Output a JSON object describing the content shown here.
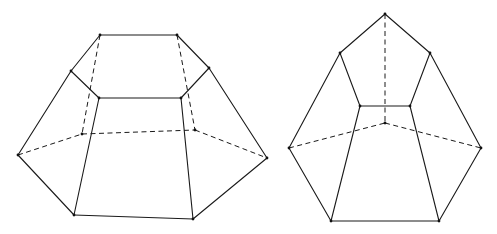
{
  "canvas": {
    "width": 497,
    "height": 234,
    "background": "#ffffff",
    "line_color": "#1a1a1a"
  },
  "figures": [
    {
      "name": "left-hexagonal-frustum",
      "vertices": {
        "t1": [
          100,
          35
        ],
        "t2": [
          177,
          35
        ],
        "tl": [
          71,
          71
        ],
        "tr": [
          209,
          68
        ],
        "fl": [
          99,
          98
        ],
        "fr": [
          181,
          98
        ],
        "bkL": [
          82,
          134
        ],
        "bkR": [
          195,
          130
        ],
        "L": [
          18,
          155
        ],
        "R": [
          267,
          158
        ],
        "bl": [
          74,
          215
        ],
        "br": [
          193,
          219
        ]
      },
      "solid_edges": [
        [
          "t1",
          "t2"
        ],
        [
          "t1",
          "tl"
        ],
        [
          "t2",
          "tr"
        ],
        [
          "tl",
          "fl"
        ],
        [
          "tr",
          "fr"
        ],
        [
          "fl",
          "fr"
        ],
        [
          "tl",
          "L"
        ],
        [
          "tr",
          "R"
        ],
        [
          "fl",
          "bl"
        ],
        [
          "fr",
          "br"
        ],
        [
          "L",
          "bl"
        ],
        [
          "bl",
          "br"
        ],
        [
          "br",
          "R"
        ]
      ],
      "dashed_edges": [
        [
          "t1",
          "bkL"
        ],
        [
          "t2",
          "bkR"
        ],
        [
          "L",
          "bkL"
        ],
        [
          "bkL",
          "bkR"
        ],
        [
          "bkR",
          "R"
        ]
      ]
    },
    {
      "name": "right-pentagonal-frustum",
      "vertices": {
        "apex": [
          385,
          14
        ],
        "ul": [
          340,
          53
        ],
        "ur": [
          430,
          53
        ],
        "il": [
          360,
          106
        ],
        "ir": [
          410,
          106
        ],
        "bk": [
          385,
          123
        ],
        "L": [
          289,
          148
        ],
        "R": [
          481,
          148
        ],
        "bl": [
          331,
          221
        ],
        "br": [
          439,
          221
        ]
      },
      "solid_edges": [
        [
          "apex",
          "ul"
        ],
        [
          "apex",
          "ur"
        ],
        [
          "ul",
          "il"
        ],
        [
          "ur",
          "ir"
        ],
        [
          "il",
          "ir"
        ],
        [
          "ul",
          "L"
        ],
        [
          "ur",
          "R"
        ],
        [
          "il",
          "bl"
        ],
        [
          "ir",
          "br"
        ],
        [
          "L",
          "bl"
        ],
        [
          "bl",
          "br"
        ],
        [
          "br",
          "R"
        ]
      ],
      "dashed_edges": [
        [
          "apex",
          "bk"
        ],
        [
          "L",
          "bk"
        ],
        [
          "bk",
          "R"
        ]
      ]
    }
  ]
}
